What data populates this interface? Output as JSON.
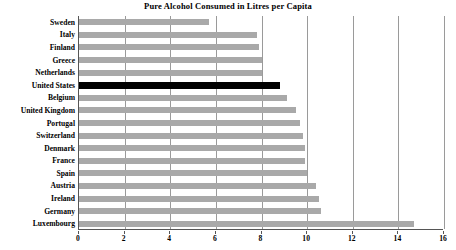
{
  "chart_data": {
    "type": "bar",
    "orientation": "horizontal",
    "title": "Pure Alcohol Consumed in Litres per Capita",
    "xlabel": "",
    "ylabel": "",
    "xlim": [
      0,
      16
    ],
    "ylim": null,
    "grid": true,
    "legend": null,
    "xticks": [
      0,
      2,
      4,
      6,
      8,
      10,
      12,
      14,
      16
    ],
    "categories": [
      "Sweden",
      "Italy",
      "Finland",
      "Greece",
      "Netherlands",
      "United States",
      "Belgium",
      "United Kingdom",
      "Portugal",
      "Switzerland",
      "Denmark",
      "France",
      "Spain",
      "Austria",
      "Ireland",
      "Germany",
      "Luxembourg"
    ],
    "values": [
      5.7,
      7.8,
      7.9,
      8.0,
      8.0,
      8.8,
      9.1,
      9.5,
      9.7,
      9.8,
      9.9,
      9.9,
      10.0,
      10.4,
      10.5,
      10.6,
      14.7
    ],
    "highlight_category": "United States",
    "colors": {
      "bar": "#a9a9a9",
      "highlight_bar": "#000000",
      "gridline": "#9a9a9a",
      "axis": "#555555",
      "background": "#ffffff",
      "text": "#000000"
    }
  }
}
